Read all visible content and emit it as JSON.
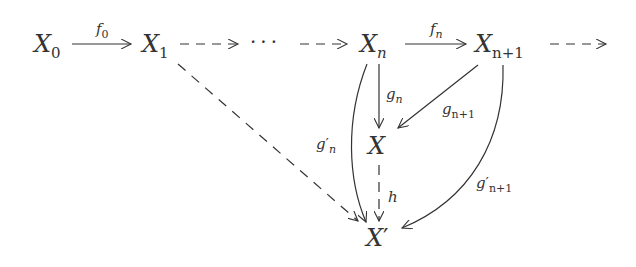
{
  "diagram": {
    "type": "commutative-diagram",
    "nodes": [
      {
        "id": "X0",
        "base": "X",
        "sub": "0",
        "sup": ""
      },
      {
        "id": "X1",
        "base": "X",
        "sub": "1",
        "sup": ""
      },
      {
        "id": "dots",
        "base": "···",
        "sub": "",
        "sup": ""
      },
      {
        "id": "Xn",
        "base": "X",
        "sub": "n",
        "sup": ""
      },
      {
        "id": "Xn1",
        "base": "X",
        "sub": "n+1",
        "sup": ""
      },
      {
        "id": "X",
        "base": "X",
        "sub": "",
        "sup": ""
      },
      {
        "id": "Xp",
        "base": "X",
        "sub": "",
        "sup": "′"
      }
    ],
    "edges": [
      {
        "from": "X0",
        "to": "X1",
        "label_base": "f",
        "label_sub": "0",
        "label_sup": "",
        "style": "solid"
      },
      {
        "from": "X1",
        "to": "dots",
        "label_base": "",
        "label_sub": "",
        "label_sup": "",
        "style": "dashed"
      },
      {
        "from": "dots",
        "to": "Xn",
        "label_base": "",
        "label_sub": "",
        "label_sup": "",
        "style": "dashed"
      },
      {
        "from": "Xn",
        "to": "Xn1",
        "label_base": "f",
        "label_sub": "n",
        "label_sup": "",
        "style": "solid"
      },
      {
        "from": "Xn1",
        "to": "…",
        "label_base": "",
        "label_sub": "",
        "label_sup": "",
        "style": "dashed"
      },
      {
        "from": "Xn",
        "to": "X",
        "label_base": "g",
        "label_sub": "n",
        "label_sup": "",
        "style": "solid"
      },
      {
        "from": "Xn1",
        "to": "X",
        "label_base": "g",
        "label_sub": "n+1",
        "label_sup": "",
        "style": "solid"
      },
      {
        "from": "Xn",
        "to": "Xp",
        "label_base": "g",
        "label_sub": "n",
        "label_sup": "′",
        "style": "solid-curved"
      },
      {
        "from": "Xn1",
        "to": "Xp",
        "label_base": "g",
        "label_sub": "n+1",
        "label_sup": "′",
        "style": "solid-curved"
      },
      {
        "from": "X",
        "to": "Xp",
        "label_base": "h",
        "label_sub": "",
        "label_sup": "",
        "style": "dashed"
      },
      {
        "from": "X1",
        "to": "Xp",
        "label_base": "",
        "label_sub": "",
        "label_sup": "",
        "style": "dashed"
      }
    ]
  }
}
